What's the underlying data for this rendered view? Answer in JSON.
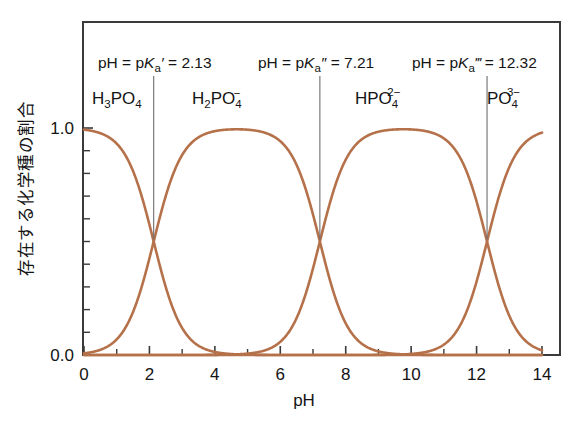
{
  "chart_data": {
    "type": "line",
    "title": "",
    "xlabel": "pH",
    "ylabel": "存在する化学種の割合",
    "xlim": [
      0,
      14
    ],
    "ylim": [
      0.0,
      1.0
    ],
    "xticks": [
      0,
      2,
      4,
      6,
      8,
      10,
      12,
      14
    ],
    "xticklabels": [
      "0",
      "2",
      "4",
      "6",
      "8",
      "10",
      "12",
      "14"
    ],
    "xminorticks": [
      1,
      3,
      5,
      7,
      9,
      11,
      13
    ],
    "yticks": [
      0.0,
      1.0
    ],
    "yticklabels": [
      "0.0",
      "1.0"
    ],
    "yminorticks": [
      0.1,
      0.2,
      0.3,
      0.4,
      0.5,
      0.6,
      0.7,
      0.8,
      0.9
    ],
    "grid": false,
    "legend": "none",
    "curve_color": "#b5714a",
    "pka": [
      2.13,
      7.21,
      12.32
    ],
    "series": [
      {
        "name": "H3PO4",
        "label": "H₃PO₄"
      },
      {
        "name": "H2PO4-",
        "label": "H₂PO₄⁻"
      },
      {
        "name": "HPO4 2-",
        "label": "HPO₄²⁻"
      },
      {
        "name": "PO4 3-",
        "label": "PO₄³⁻"
      }
    ],
    "annotations": [
      {
        "id": "pka1",
        "text": "pH = pKa′ = 2.13",
        "x": 2.13,
        "y": 0.5
      },
      {
        "id": "pka2",
        "text": "pH = pKa″ = 7.21",
        "x": 7.21,
        "y": 0.5
      },
      {
        "id": "pka3",
        "text": "pH = pKa‴ = 12.32",
        "x": 12.32,
        "y": 0.5
      }
    ],
    "species_label_positions": [
      {
        "species": "H3PO4",
        "x": 0.75
      },
      {
        "species": "H2PO4-",
        "x": 4.6
      },
      {
        "species": "HPO4 2-",
        "x": 9.6
      },
      {
        "species": "PO4 3-",
        "x": 13.3
      }
    ]
  },
  "axes": {
    "x_title": "pH",
    "y_title": "存在する化学種の割合",
    "x_tick_labels": [
      "0",
      "2",
      "4",
      "6",
      "8",
      "10",
      "12",
      "14"
    ],
    "y_tick_labels": [
      "1.0",
      "0.0"
    ]
  },
  "annotations": {
    "pka1": {
      "prefix": "pH = p",
      "k": "K",
      "sub": "a",
      "prime": "′",
      "eq": " = ",
      "value": "2.13"
    },
    "pka2": {
      "prefix": "pH = p",
      "k": "K",
      "sub": "a",
      "prime": "″",
      "eq": " = ",
      "value": "7.21"
    },
    "pka3": {
      "prefix": "pH = p",
      "k": "K",
      "sub": "a",
      "prime": "‴",
      "eq": " = ",
      "value": "12.32"
    }
  },
  "species": {
    "s1": {
      "base": "H",
      "sub1": "3",
      "mid": "PO",
      "sub2": "4",
      "charge": ""
    },
    "s2": {
      "base": "H",
      "sub1": "2",
      "mid": "PO",
      "sub2": "4",
      "charge": "−"
    },
    "s3": {
      "base": "H",
      "sub1": "",
      "mid": "PO",
      "sub2": "4",
      "charge": "2−"
    },
    "s4": {
      "base": "",
      "sub1": "",
      "mid": "PO",
      "sub2": "4",
      "charge": "3−"
    }
  },
  "colors": {
    "curve": "#b5714a",
    "frame": "#3a3a3a",
    "pointer": "#6e6e72",
    "text": "#141414",
    "background": "#ffffff"
  }
}
